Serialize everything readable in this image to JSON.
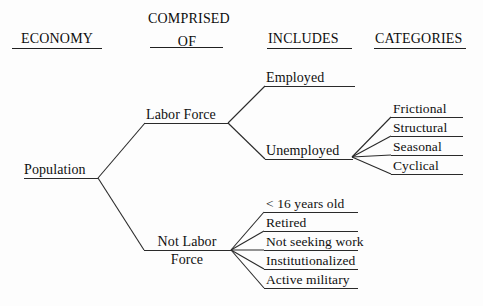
{
  "diagram": {
    "line_color": "#2a2a2a",
    "text_color": "#101010",
    "background_color": "#fdfdfd"
  },
  "headers": [
    {
      "id": "economy",
      "lines": [
        "ECONOMY"
      ]
    },
    {
      "id": "comprised-of",
      "lines": [
        "COMPRISED",
        "OF"
      ]
    },
    {
      "id": "includes",
      "lines": [
        "INCLUDES"
      ]
    },
    {
      "id": "categories",
      "lines": [
        "CATEGORIES"
      ]
    }
  ],
  "nodes": {
    "population": {
      "label": "Population"
    },
    "labor_force": {
      "label": "Labor Force"
    },
    "not_labor_force": {
      "line1": "Not Labor",
      "line2": "Force"
    },
    "employed": {
      "label": "Employed"
    },
    "unemployed": {
      "label": "Unemployed"
    }
  },
  "unemployment_categories": [
    {
      "label": "Frictional"
    },
    {
      "label": "Structural"
    },
    {
      "label": "Seasonal"
    },
    {
      "label": "Cyclical"
    }
  ],
  "not_labor_force_items": [
    {
      "label": "< 16 years old"
    },
    {
      "label": "Retired"
    },
    {
      "label": "Not seeking work"
    },
    {
      "label": "Institutionalized"
    },
    {
      "label": "Active military"
    }
  ]
}
